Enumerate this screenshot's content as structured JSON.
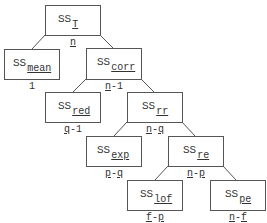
{
  "diagram": {
    "nodes": [
      {
        "id": "T",
        "ss": "SS",
        "sub": "T",
        "df_parts": [
          "n"
        ],
        "df_sep": "",
        "x": 45,
        "y": 5,
        "w": 56,
        "h": 31
      },
      {
        "id": "mean",
        "ss": "SS",
        "sub": "mean",
        "df_parts": [
          "1"
        ],
        "df_sep": "",
        "x": 4,
        "y": 49,
        "w": 56,
        "h": 31
      },
      {
        "id": "corr",
        "ss": "SS",
        "sub": "corr",
        "df_parts": [
          "n",
          "1"
        ],
        "df_sep": "-",
        "x": 86,
        "y": 48,
        "w": 56,
        "h": 32
      },
      {
        "id": "red",
        "ss": "SS",
        "sub": "red",
        "df_parts": [
          "q",
          "1"
        ],
        "df_sep": "-",
        "x": 45,
        "y": 92,
        "w": 56,
        "h": 31
      },
      {
        "id": "rr",
        "ss": "SS",
        "sub": "rr",
        "df_parts": [
          "n",
          "q"
        ],
        "df_sep": "-",
        "x": 127,
        "y": 92,
        "w": 56,
        "h": 31
      },
      {
        "id": "exp",
        "ss": "SS",
        "sub": "exp",
        "df_parts": [
          "p",
          "q"
        ],
        "df_sep": "-",
        "x": 86,
        "y": 136,
        "w": 56,
        "h": 31
      },
      {
        "id": "re",
        "ss": "SS",
        "sub": "re",
        "df_parts": [
          "n",
          "p"
        ],
        "df_sep": "-",
        "x": 168,
        "y": 136,
        "w": 56,
        "h": 31
      },
      {
        "id": "lof",
        "ss": "SS",
        "sub": "lof",
        "df_parts": [
          "f",
          "p"
        ],
        "df_sep": "-",
        "x": 127,
        "y": 180,
        "w": 56,
        "h": 31
      },
      {
        "id": "pe",
        "ss": "SS",
        "sub": "pe",
        "df_parts": [
          "n",
          "f"
        ],
        "df_sep": "-",
        "x": 210,
        "y": 180,
        "w": 56,
        "h": 31
      }
    ],
    "edges": [
      {
        "from": "T",
        "to": "mean"
      },
      {
        "from": "T",
        "to": "corr"
      },
      {
        "from": "corr",
        "to": "red"
      },
      {
        "from": "corr",
        "to": "rr"
      },
      {
        "from": "rr",
        "to": "exp"
      },
      {
        "from": "rr",
        "to": "re"
      },
      {
        "from": "re",
        "to": "lof"
      },
      {
        "from": "re",
        "to": "pe"
      }
    ],
    "labels": {
      "T": {
        "ss": "SS",
        "sub": "T",
        "df": "n"
      },
      "mean": {
        "ss": "SS",
        "sub": "mean",
        "df": "1"
      },
      "corr": {
        "ss": "SS",
        "sub": "corr",
        "df": "n-1"
      },
      "red": {
        "ss": "SS",
        "sub": "red",
        "df": "q-1"
      },
      "rr": {
        "ss": "SS",
        "sub": "rr",
        "df": "n-q"
      },
      "exp": {
        "ss": "SS",
        "sub": "exp",
        "df": "p-q"
      },
      "re": {
        "ss": "SS",
        "sub": "re",
        "df": "n-p"
      },
      "lof": {
        "ss": "SS",
        "sub": "lof",
        "df": "f-p"
      },
      "pe": {
        "ss": "SS",
        "sub": "pe",
        "df": "n-f"
      }
    },
    "colors": {
      "stroke": "#555555",
      "text": "#333333",
      "background": "#ffffff"
    }
  }
}
